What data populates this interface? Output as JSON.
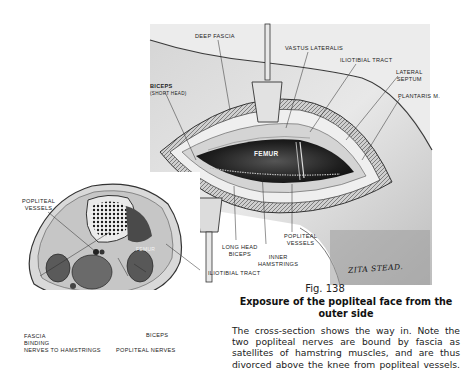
{
  "figure": {
    "number_label": "Fig. 138",
    "title": "Exposure of the popliteal face from the outer side",
    "body_lines": [
      "The cross-section shows the way in.  Note the",
      "two popliteal nerves are bound by fascia as",
      "satellites of hamstring muscles, and are thus",
      "divorced above the knee from popliteal vessels."
    ],
    "artist_signature": "ZITA STEAD."
  },
  "main_illustration": {
    "labels": {
      "deep_fascia": "DEEP FASCIA",
      "vastus_lateralis": "VASTUS LATERALIS",
      "iliotibial_tract_top": "ILIOTIBIAL TRACT",
      "lateral_septum": "LATERAL\nSEPTUM",
      "plantaris": "PLANTARIS M.",
      "biceps_short": "BICEPS",
      "biceps_short_sub": "(SHORT HEAD)",
      "femur": "FEMUR",
      "long_head_biceps": "LONG HEAD\nBICEPS",
      "inner_hamstrings": "INNER\nHAMSTRINGS",
      "popliteal_vessels": "POPLITEAL\nVESSELS",
      "iliotibial_tract_bottom": "ILIOTIBIAL TRACT"
    }
  },
  "cross_section": {
    "labels": {
      "popliteal_vessels": "POPLITEAL\nVESSELS",
      "femur": "FEMUR",
      "fascia_binding": "FASCIA\nBINDING\nNERVES to HAMSTRINGS",
      "biceps": "BICEPS",
      "popliteal_nerves": "POPLITEAL NERVES"
    }
  },
  "colors": {
    "paper": "#ffffff",
    "ink": "#1a1a1a",
    "skin_light": "#e4e4e4",
    "skin_mid": "#c8c8c8",
    "cavity_dark": "#2a2a2a"
  }
}
